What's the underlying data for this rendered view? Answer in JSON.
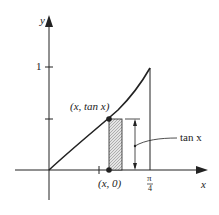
{
  "diagram": {
    "axis_labels": {
      "x": "x",
      "y": "y"
    },
    "y_tick_label": "1",
    "point_top_label": "(x, tan x)",
    "point_bottom_label": "(x, 0)",
    "x_tick_label_num": "π",
    "x_tick_label_den": "4",
    "annotation": "tan x",
    "colors": {
      "ink": "#222222",
      "shade": "#cfcfcf"
    }
  }
}
